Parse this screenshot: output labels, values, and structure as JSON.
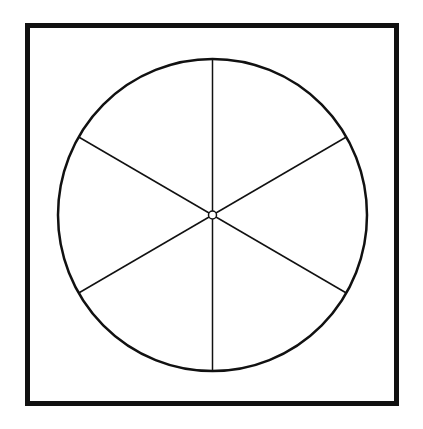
{
  "diagram": {
    "type": "divided-circle",
    "canvas": {
      "width": 423,
      "height": 429,
      "background": "#ffffff"
    },
    "frame": {
      "x": 27.5,
      "y": 25.5,
      "width": 369,
      "height": 378,
      "stroke": "#111111",
      "stroke_width": 5
    },
    "circle": {
      "cx": 212.5,
      "cy": 215,
      "rx": 154.5,
      "ry": 156,
      "stroke": "#111111",
      "stroke_width": 2.5
    },
    "spokes": {
      "count": 6,
      "angles_deg": [
        0,
        60,
        120,
        180,
        240,
        300
      ],
      "stroke": "#111111",
      "stroke_width": 1.5
    },
    "hub": {
      "r": 4,
      "stroke": "#111111",
      "stroke_width": 1.5
    }
  }
}
